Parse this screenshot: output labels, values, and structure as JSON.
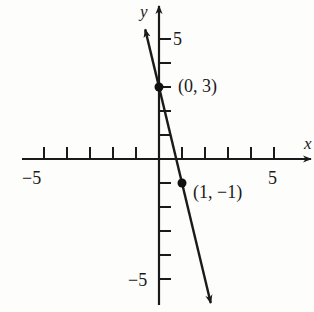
{
  "chart_data": {
    "type": "line",
    "title": "",
    "xlabel": "x",
    "ylabel": "y",
    "xlim": [
      -6,
      6
    ],
    "ylim": [
      -6,
      6
    ],
    "grid": false,
    "legend": null,
    "x_ticks": [
      -5,
      -4,
      -3,
      -2,
      -1,
      1,
      2,
      3,
      4,
      5
    ],
    "y_ticks": [
      -5,
      -4,
      -3,
      -2,
      -1,
      1,
      2,
      3,
      4,
      5
    ],
    "x_tick_labels": {
      "-5": "−5",
      "5": "5"
    },
    "y_tick_labels": {
      "-5": "−5",
      "5": "5"
    },
    "series": [
      {
        "name": "y = -4x + 3",
        "slope": -4,
        "intercept": 3,
        "extends_both_ways": true,
        "points": [
          {
            "x": 0,
            "y": 3,
            "label": "(0, 3)"
          },
          {
            "x": 1,
            "y": -1,
            "label": "(1, −1)"
          }
        ]
      }
    ]
  },
  "labels": {
    "x_axis": "x",
    "y_axis": "y",
    "x_min": "−5",
    "x_max": "5",
    "y_max": "5",
    "y_min": "−5",
    "point_a": "(0, 3)",
    "point_b": "(1, −1)"
  }
}
